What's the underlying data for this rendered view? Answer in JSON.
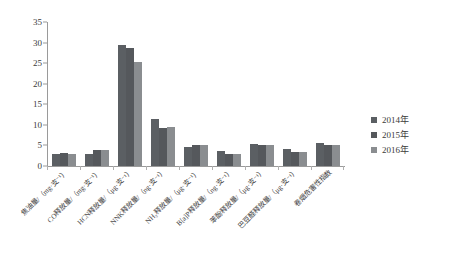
{
  "chart_data": {
    "type": "bar",
    "title": "",
    "subtitle": "",
    "xlabel": "",
    "ylabel": "",
    "ylim": [
      0,
      35
    ],
    "ytick_step": 5,
    "yticks": [
      "0",
      "5",
      "10",
      "15",
      "20",
      "25",
      "30",
      "35"
    ],
    "grid": false,
    "legend_position": "right",
    "categories": [
      "焦油量/（mg·支⁻¹）",
      "CO释放量/（mg·支⁻¹）",
      "HCN释放量/（μg·支⁻¹）",
      "NNK释放量/（ng·支⁻¹）",
      "NH₃释放量/（μg·支⁻¹）",
      "B[a]P释放量/（ng·支⁻¹）",
      "苯酚释放量/（μg·支⁻¹）",
      "巴豆醛释放量/（μg·支⁻¹）",
      "卷烟危害性指数"
    ],
    "series": [
      {
        "name": "2014年",
        "color": "#5b5f63",
        "values": [
          3.0,
          3.0,
          29.4,
          11.5,
          4.7,
          3.6,
          5.3,
          4.2,
          5.6
        ]
      },
      {
        "name": "2015年",
        "color": "#55585c",
        "values": [
          3.1,
          3.9,
          28.8,
          9.3,
          5.0,
          2.9,
          5.2,
          3.5,
          5.2
        ]
      },
      {
        "name": "2016年",
        "color": "#8a8d90",
        "values": [
          3.0,
          4.0,
          25.4,
          9.4,
          5.1,
          2.8,
          5.1,
          3.3,
          5.1
        ]
      }
    ]
  },
  "legend": {
    "items": [
      {
        "label": "2014年",
        "color": "#5b5f63"
      },
      {
        "label": "2015年",
        "color": "#55585c"
      },
      {
        "label": "2016年",
        "color": "#8a8d90"
      }
    ]
  },
  "axis": {
    "y_max_label": "35",
    "y_min_label": "0"
  }
}
